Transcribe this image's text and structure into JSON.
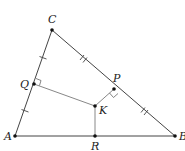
{
  "diagram": {
    "type": "geometry-triangle",
    "colors": {
      "line": "#444444",
      "inner_line": "#888888",
      "point": "#111111",
      "label": "#222222"
    },
    "points": {
      "A": {
        "label": "A",
        "x": 15,
        "y": 136
      },
      "B": {
        "label": "B",
        "x": 175,
        "y": 136
      },
      "C": {
        "label": "C",
        "x": 52,
        "y": 30
      },
      "P": {
        "label": "P",
        "x": 114,
        "y": 89
      },
      "Q": {
        "label": "Q",
        "x": 34,
        "y": 84
      },
      "K": {
        "label": "K",
        "x": 95,
        "y": 106
      },
      "R": {
        "label": "R",
        "x": 95,
        "y": 136
      }
    },
    "segments": [
      {
        "from": "A",
        "to": "B",
        "style": "side"
      },
      {
        "from": "B",
        "to": "C",
        "style": "side"
      },
      {
        "from": "C",
        "to": "A",
        "style": "side"
      },
      {
        "from": "K",
        "to": "P",
        "style": "perpendicular"
      },
      {
        "from": "K",
        "to": "Q",
        "style": "perpendicular"
      },
      {
        "from": "K",
        "to": "R",
        "style": "perpendicular"
      }
    ],
    "tick_marks": [
      {
        "segment": "CQ",
        "count": 1
      },
      {
        "segment": "QA",
        "count": 1
      },
      {
        "segment": "CP",
        "count": 2
      },
      {
        "segment": "PB",
        "count": 2
      }
    ],
    "right_angles": [
      "P",
      "Q"
    ]
  }
}
